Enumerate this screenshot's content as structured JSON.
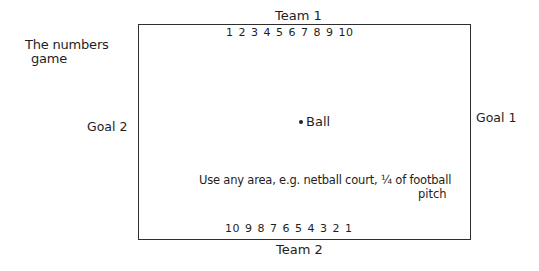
{
  "title": {
    "line1": "The numbers",
    "line2": "game"
  },
  "pitch": {
    "team_top": "Team 1",
    "team_bottom": "Team 2",
    "numbers_top": "1 2 3 4 5 6 7 8 9 10",
    "numbers_bottom": "10 9 8 7 6 5 4 3 2 1",
    "goal_left": "Goal 2",
    "goal_right": "Goal 1",
    "ball_label": "Ball",
    "note_line1": "Use any area, e.g. netball court, ¼ of football",
    "note_line2": "pitch"
  }
}
